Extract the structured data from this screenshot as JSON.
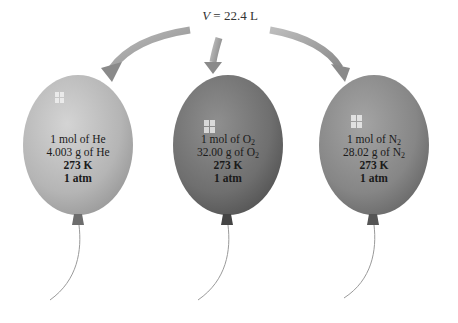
{
  "diagram": {
    "volume_label": {
      "symbol": "V",
      "equals": " = 22.4 L"
    },
    "arrows": [
      {
        "target": "He balloon",
        "direction": "left-curve"
      },
      {
        "target": "O2 balloon",
        "direction": "down"
      },
      {
        "target": "N2 balloon",
        "direction": "right-curve"
      }
    ],
    "balloons": [
      {
        "gas": "He",
        "color": "#b8b8b8",
        "line1": "1 mol of He",
        "line2": "4.003 g of He",
        "line3": "273 K",
        "line4": "1 atm"
      },
      {
        "gas": "O2",
        "color": "#7a7a7a",
        "line1_prefix": "1 mol of O",
        "line1_sub": "2",
        "line2_prefix": "32.00 g of O",
        "line2_sub": "2",
        "line3": "273 K",
        "line4": "1 atm"
      },
      {
        "gas": "N2",
        "color": "#8e8e8e",
        "line1_prefix": "1 mol of N",
        "line1_sub": "2",
        "line2_prefix": "28.02 g of N",
        "line2_sub": "2",
        "line3": "273 K",
        "line4": "1 atm"
      }
    ]
  }
}
